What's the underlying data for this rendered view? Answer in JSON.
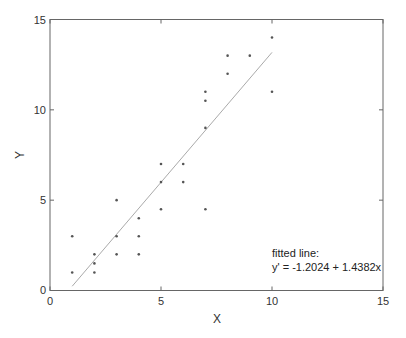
{
  "chart_data": {
    "type": "scatter",
    "title": "",
    "xlabel": "X",
    "ylabel": "Y",
    "xlim": [
      0,
      15
    ],
    "ylim": [
      0,
      15
    ],
    "xticks": [
      0,
      5,
      10,
      15
    ],
    "yticks": [
      0,
      5,
      10,
      15
    ],
    "grid": false,
    "legend": null,
    "series": [
      {
        "name": "data",
        "marker": "dot",
        "points": [
          [
            1,
            1
          ],
          [
            1,
            3
          ],
          [
            2,
            1
          ],
          [
            2,
            1.5
          ],
          [
            2,
            2
          ],
          [
            3,
            2
          ],
          [
            3,
            3
          ],
          [
            3,
            5
          ],
          [
            4,
            2
          ],
          [
            4,
            3
          ],
          [
            4,
            4
          ],
          [
            5,
            4.5
          ],
          [
            5,
            6
          ],
          [
            5,
            7
          ],
          [
            6,
            6
          ],
          [
            6,
            7
          ],
          [
            7,
            4.5
          ],
          [
            7,
            9
          ],
          [
            7,
            10.5
          ],
          [
            7,
            11
          ],
          [
            8,
            12
          ],
          [
            8,
            13
          ],
          [
            9,
            13
          ],
          [
            10,
            11
          ],
          [
            10,
            14
          ]
        ]
      },
      {
        "name": "fitted line",
        "type": "line",
        "intercept": -1.2024,
        "slope": 1.4382,
        "x_range": [
          1,
          10
        ]
      }
    ],
    "annotations": [
      {
        "text": "fitted line:",
        "x": 10,
        "y": 2.5
      },
      {
        "text": "y' = -1.2024 + 1.4382x",
        "x": 10,
        "y": 1.6
      }
    ]
  },
  "labels": {
    "xlabel": "X",
    "ylabel": "Y",
    "annot_line1": "fitted line:",
    "annot_line2": "y' = -1.2024 + 1.4382x",
    "xticks": [
      "0",
      "5",
      "10",
      "15"
    ],
    "yticks": [
      "0",
      "5",
      "10",
      "15"
    ]
  },
  "colors": {
    "axis": "#555555",
    "points": "#555555",
    "fit_line": "#aaaaaa"
  }
}
